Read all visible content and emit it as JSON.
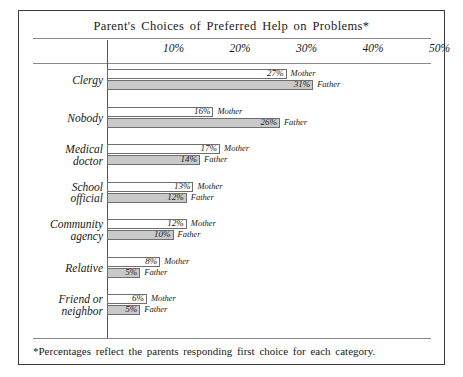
{
  "chart_data": {
    "type": "bar",
    "title": "Parent's Choices of Preferred Help on Problems*",
    "xlabel": "",
    "ylabel": "",
    "orientation": "horizontal",
    "grid": false,
    "legend_position": "inline-right-of-bar",
    "xlim": [
      0,
      55
    ],
    "xticks": [
      "10%",
      "20%",
      "30%",
      "40%",
      "50%"
    ],
    "xtick_values": [
      10,
      20,
      30,
      40,
      50
    ],
    "categories": [
      "Clergy",
      "Nobody",
      "Medical doctor",
      "School official",
      "Community agency",
      "Relative",
      "Friend or neighbor"
    ],
    "category_lines": [
      [
        "Clergy"
      ],
      [
        "Nobody"
      ],
      [
        "Medical",
        "doctor"
      ],
      [
        "School",
        "official"
      ],
      [
        "Community",
        "agency"
      ],
      [
        "Relative"
      ],
      [
        "Friend or",
        "neighbor"
      ]
    ],
    "series": [
      {
        "name": "Mother",
        "values": [
          27,
          16,
          17,
          13,
          12,
          8,
          6
        ],
        "labels": [
          "27%",
          "16%",
          "17%",
          "13%",
          "12%",
          "8%",
          "6%"
        ],
        "color": "#ffffff"
      },
      {
        "name": "Father",
        "values": [
          31,
          26,
          14,
          12,
          10,
          5,
          5
        ],
        "labels": [
          "31%",
          "26%",
          "14%",
          "12%",
          "10%",
          "5%",
          "5%"
        ],
        "color": "#c9c9c9"
      }
    ],
    "footnote": "*Percentages reflect the parents responding first choice for each category."
  }
}
